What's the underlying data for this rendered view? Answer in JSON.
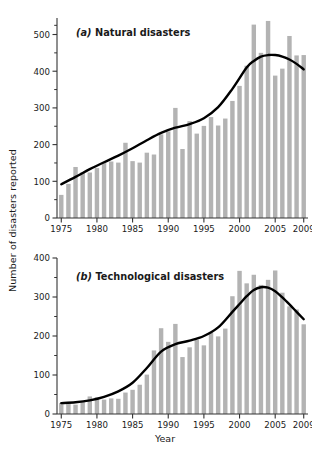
{
  "figure": {
    "axis_title_y": "Number of disasters reported",
    "axis_title_x": "Year",
    "bar_color": "#b3b3b3",
    "line_color": "#000000",
    "background": "#ffffff"
  },
  "chart_data": [
    {
      "type": "bar",
      "panel": "a",
      "title": "(a) Natural disasters",
      "title_prefix_italic": "(a)",
      "title_rest": "Natural disasters",
      "xlabel": "",
      "ylabel": "Number of disasters reported",
      "xlim": [
        1974.4,
        2009.6
      ],
      "ylim": [
        0,
        545
      ],
      "yticks": [
        0,
        100,
        200,
        300,
        400,
        500
      ],
      "yticklabels": [
        "0",
        "100",
        "200",
        "300",
        "400",
        "500"
      ],
      "yminorticks": [
        50,
        150,
        250,
        350,
        450,
        525
      ],
      "xticks": [
        1975,
        1980,
        1985,
        1990,
        1995,
        2000,
        2005,
        2009
      ],
      "xticklabels": [
        "1975",
        "1980",
        "1985",
        "1990",
        "1995",
        "2000",
        "2005",
        "2009"
      ],
      "grid": false,
      "legend": "none",
      "categories": [
        1975,
        1976,
        1977,
        1978,
        1979,
        1980,
        1981,
        1982,
        1983,
        1984,
        1985,
        1986,
        1987,
        1988,
        1989,
        1990,
        1991,
        1992,
        1993,
        1994,
        1995,
        1996,
        1997,
        1998,
        1999,
        2000,
        2001,
        2002,
        2003,
        2004,
        2005,
        2006,
        2007,
        2008,
        2009
      ],
      "values": [
        63,
        93,
        139,
        125,
        124,
        136,
        152,
        154,
        151,
        205,
        155,
        151,
        178,
        173,
        228,
        236,
        300,
        188,
        264,
        230,
        251,
        275,
        252,
        271,
        319,
        360,
        415,
        527,
        450,
        537,
        388,
        407,
        496,
        443,
        444,
        395,
        371
      ],
      "series": [
        {
          "name": "Number of natural disasters reported",
          "type": "bar",
          "values": [
            63,
            93,
            139,
            125,
            124,
            136,
            152,
            154,
            151,
            205,
            155,
            151,
            178,
            173,
            228,
            236,
            300,
            188,
            264,
            230,
            251,
            275,
            252,
            271,
            319,
            360,
            415,
            527,
            450,
            537,
            388,
            407,
            496,
            443,
            444,
            395,
            371
          ]
        },
        {
          "name": "Smoothed trend",
          "type": "line",
          "x": [
            1975,
            1977,
            1979,
            1981,
            1983,
            1985,
            1987,
            1989,
            1991,
            1993,
            1995,
            1997,
            1999,
            2001,
            2002,
            2003,
            2004,
            2005,
            2006,
            2007,
            2008,
            2009
          ],
          "values": [
            92,
            112,
            133,
            152,
            170,
            190,
            212,
            232,
            246,
            256,
            272,
            302,
            352,
            410,
            428,
            440,
            444,
            444,
            440,
            432,
            420,
            405
          ]
        }
      ]
    },
    {
      "type": "bar",
      "panel": "b",
      "title": "(b) Technological disasters",
      "title_prefix_italic": "(b)",
      "title_rest": "Technological disasters",
      "xlabel": "Year",
      "ylabel": "Number of disasters reported",
      "xlim": [
        1974.4,
        2009.6
      ],
      "ylim": [
        0,
        400
      ],
      "yticks": [
        0,
        100,
        200,
        300,
        400
      ],
      "yticklabels": [
        "0",
        "100",
        "200",
        "300",
        "400"
      ],
      "yminorticks": [
        50,
        150,
        250,
        350
      ],
      "xticks": [
        1975,
        1980,
        1985,
        1990,
        1995,
        2000,
        2005,
        2009
      ],
      "xticklabels": [
        "1975",
        "1980",
        "1985",
        "1990",
        "1995",
        "2000",
        "2005",
        "2009"
      ],
      "grid": false,
      "legend": "none",
      "categories": [
        1975,
        1976,
        1977,
        1978,
        1979,
        1980,
        1981,
        1982,
        1983,
        1984,
        1985,
        1986,
        1987,
        1988,
        1989,
        1990,
        1991,
        1992,
        1993,
        1994,
        1995,
        1996,
        1997,
        1998,
        1999,
        2000,
        2001,
        2002,
        2003,
        2004,
        2005,
        2006,
        2007,
        2008,
        2009
      ],
      "values": [
        28,
        30,
        24,
        31,
        45,
        43,
        37,
        40,
        39,
        55,
        62,
        75,
        101,
        163,
        220,
        185,
        231,
        146,
        171,
        190,
        176,
        208,
        199,
        219,
        302,
        367,
        335,
        357,
        331,
        344,
        368,
        311,
        276,
        268,
        230
      ],
      "series": [
        {
          "name": "Number of technological disasters reported",
          "type": "bar",
          "values": [
            28,
            30,
            24,
            31,
            45,
            43,
            37,
            40,
            39,
            55,
            62,
            75,
            101,
            163,
            220,
            185,
            231,
            146,
            171,
            190,
            176,
            208,
            199,
            219,
            302,
            367,
            335,
            357,
            331,
            344,
            368,
            311,
            276,
            268,
            230
          ]
        },
        {
          "name": "Smoothed trend",
          "type": "line",
          "x": [
            1975,
            1977,
            1979,
            1981,
            1983,
            1985,
            1987,
            1989,
            1991,
            1993,
            1995,
            1997,
            1999,
            2000,
            2001,
            2002,
            2003,
            2004,
            2005,
            2006,
            2007,
            2008,
            2009
          ],
          "values": [
            28,
            30,
            35,
            44,
            58,
            80,
            118,
            160,
            179,
            188,
            200,
            222,
            262,
            282,
            302,
            318,
            325,
            324,
            315,
            299,
            281,
            262,
            243
          ]
        }
      ]
    }
  ]
}
